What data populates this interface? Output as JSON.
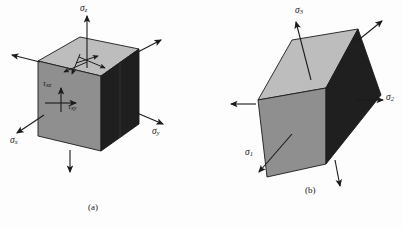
{
  "figure": {
    "background_color": "#fdfdfd",
    "ink_color": "#1b1b1b",
    "panels": [
      {
        "id": "panel-a",
        "caption": "(a)",
        "caption_x": 88,
        "caption_y": 202,
        "description": "Cube showing general stress state with normal stresses and shear stresses",
        "faces": {
          "top_color": "#bdbdbd",
          "left_color": "#8f8f8f",
          "right_color": "#1f1f1f"
        },
        "labels": [
          {
            "name": "sigma-z",
            "base": "σ",
            "sub": "z",
            "x": 80,
            "y": 4
          },
          {
            "name": "sigma-x",
            "base": "σ",
            "sub": "x",
            "x": 10,
            "y": 136
          },
          {
            "name": "sigma-y",
            "base": "σ",
            "sub": "y",
            "x": 152,
            "y": 130
          },
          {
            "name": "tau-xz",
            "base": "τ",
            "sub": "xz",
            "x": 43,
            "y": 83
          },
          {
            "name": "tau-xy",
            "base": "τ",
            "sub": "xy",
            "x": 70,
            "y": 104
          }
        ]
      },
      {
        "id": "panel-b",
        "caption": "(b)",
        "caption_x": 305,
        "caption_y": 185,
        "description": "Rotated cube showing principal stress state with three principal stresses",
        "faces": {
          "top_color": "#bdbdbd",
          "left_color": "#8f8f8f",
          "right_color": "#1f1f1f"
        },
        "labels": [
          {
            "name": "sigma-3",
            "base": "σ",
            "sub": "3",
            "x": 295,
            "y": 8
          },
          {
            "name": "sigma-2",
            "base": "σ",
            "sub": "2",
            "x": 387,
            "y": 93
          },
          {
            "name": "sigma-1",
            "base": "σ",
            "sub": "1",
            "x": 245,
            "y": 148
          }
        ]
      }
    ]
  }
}
